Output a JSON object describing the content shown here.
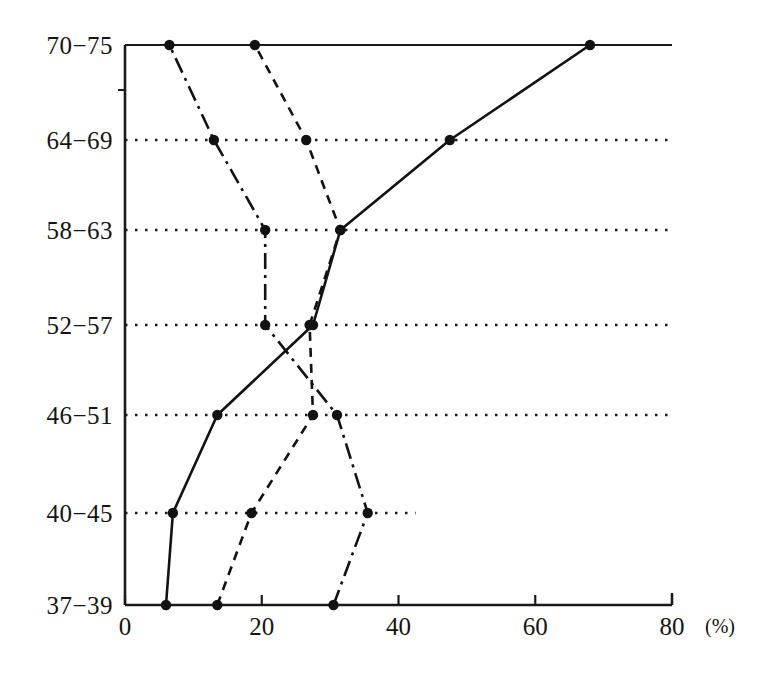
{
  "chart_data": {
    "type": "line",
    "title": "",
    "subtitle": "",
    "xlabel": "",
    "ylabel": "",
    "unit_label": "(%)",
    "orientation": "horizontal",
    "grid": true,
    "grid_style": "dotted",
    "legend": "none",
    "xlim": [
      0,
      80
    ],
    "xticks": [
      0,
      20,
      40,
      60,
      80
    ],
    "xticklabels": [
      "0",
      "20",
      "40",
      "60",
      "80"
    ],
    "categories": [
      "37-39",
      "40-45",
      "46-51",
      "52-57",
      "58-63",
      "64-69",
      "70-75"
    ],
    "category_order_top_to_bottom": [
      "70-75",
      "64-69",
      "58-63",
      "52-57",
      "46-51",
      "40-45",
      "37-39"
    ],
    "series": [
      {
        "name": "series-solid",
        "line_style": "solid",
        "marker": "filled-circle",
        "values": [
          6.0,
          7.0,
          13.5,
          27.5,
          31.5,
          47.5,
          68.0
        ]
      },
      {
        "name": "series-dashed",
        "line_style": "dashed",
        "marker": "filled-circle",
        "values": [
          13.5,
          18.5,
          27.5,
          27.0,
          31.5,
          26.5,
          19.0
        ]
      },
      {
        "name": "series-dash-dot",
        "line_style": "dash-dot",
        "marker": "filled-circle",
        "values": [
          30.5,
          35.5,
          31.0,
          20.5,
          20.5,
          13.0,
          6.5
        ]
      }
    ]
  },
  "axes": {
    "y_tick_labels": [
      "70-75",
      "64-69",
      "58-63",
      "52-57",
      "46-51",
      "40-45",
      "37-39"
    ],
    "x_tick_labels": [
      "0",
      "20",
      "40",
      "60",
      "80"
    ],
    "unit": "(%)"
  }
}
